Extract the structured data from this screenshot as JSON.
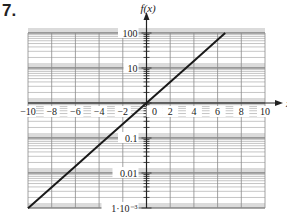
{
  "problem": {
    "number": "7."
  },
  "chart_data": {
    "type": "line",
    "title": "",
    "xlabel": "x",
    "ylabel": "f(x)",
    "y_scale": "log",
    "xlim": [
      -10,
      10
    ],
    "ylim": [
      0.001,
      100
    ],
    "x_ticks": [
      -10,
      -8,
      -6,
      -4,
      -2,
      0,
      2,
      4,
      6,
      8,
      10
    ],
    "x_tick_labels": [
      "−10",
      "−8",
      "−6",
      "−4",
      "−2",
      "0",
      "2",
      "4",
      "6",
      "8",
      "10"
    ],
    "y_ticks": [
      100,
      10,
      0.1,
      0.01,
      0.001
    ],
    "y_tick_labels": [
      "100",
      "10",
      "0.1",
      "0.01",
      "1·10⁻³"
    ],
    "grid": true,
    "series": [
      {
        "name": "f(x)",
        "x": [
          -10,
          -8,
          -6,
          -4,
          -2,
          0,
          2,
          4,
          6,
          6.64
        ],
        "y": [
          0.00098,
          0.0039,
          0.0156,
          0.0625,
          0.25,
          1,
          4,
          16,
          64,
          100
        ]
      }
    ],
    "line_color": "#1a1a1a",
    "grid_color": "#8a8a8a",
    "decade_band_color": "#bdbdbd"
  }
}
